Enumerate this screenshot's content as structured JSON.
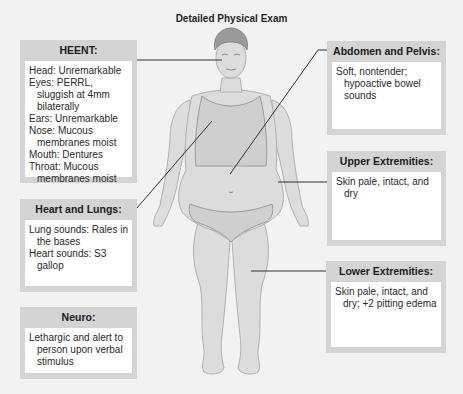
{
  "title": "Detailed Physical Exam",
  "colors": {
    "background": "#f2f2f2",
    "box_frame": "#d4d4d4",
    "box_body": "#ffffff",
    "skin": "#dcdcdc",
    "hair": "#9a9a9a",
    "leader_line": "#333333"
  },
  "boxes": {
    "heent": {
      "header": "HEENT:",
      "lines": [
        "Head: Unremarkable",
        "Eyes: PERRL, sluggish at 4mm bilaterally",
        "Ears: Unremarkable",
        "Nose: Mucous membranes moist",
        "Mouth: Dentures",
        "Throat: Mucous membranes moist"
      ]
    },
    "heart_lungs": {
      "header": "Heart and Lungs:",
      "lines": [
        "Lung sounds: Rales in the bases",
        "Heart sounds: S3 gallop"
      ]
    },
    "neuro": {
      "header": "Neuro:",
      "lines": [
        "Lethargic and alert to person upon verbal stimulus"
      ]
    },
    "abdomen_pelvis": {
      "header": "Abdomen and Pelvis:",
      "lines": [
        "Soft, nontender; hypoactive bowel sounds"
      ]
    },
    "upper_extremities": {
      "header": "Upper Extremities:",
      "lines": [
        "Skin pale, intact, and dry"
      ]
    },
    "lower_extremities": {
      "header": "Lower Extremities:",
      "lines": [
        "Skin pale, intact, and dry; +2 pitting edema"
      ]
    }
  }
}
